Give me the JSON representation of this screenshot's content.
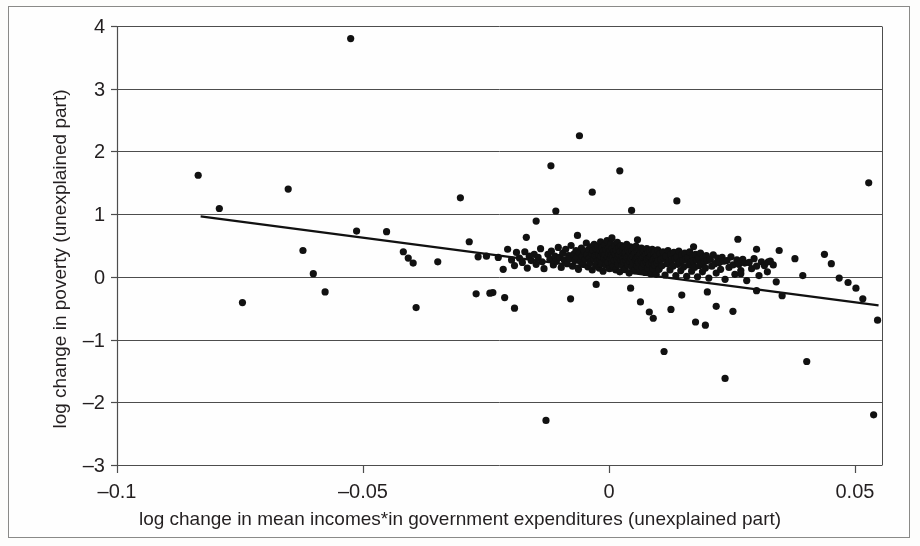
{
  "chart_data": {
    "type": "scatter",
    "title": "",
    "xlabel": "log change in mean incomes*in government expenditures (unexplained part)",
    "ylabel": "log change in poverty (unexplained part)",
    "xlim": [
      -0.1,
      0.0555
    ],
    "ylim": [
      -3,
      4
    ],
    "xticks": [
      -0.1,
      -0.05,
      0,
      0.05
    ],
    "xtick_labels": [
      "–0.1",
      "–0.05",
      "0",
      "0.05"
    ],
    "yticks": [
      -3,
      -2,
      -1,
      0,
      1,
      2,
      3,
      4
    ],
    "ytick_labels": [
      "–3",
      "–2",
      "–1",
      "0",
      "1",
      "2",
      "3",
      "4"
    ],
    "grid": "horizontal",
    "grid_color": "#4d4d4d",
    "marker_color": "#111111",
    "marker_size_px": 7.2,
    "legend": null,
    "trendline": {
      "label": "fitted regression line",
      "color": "#111111",
      "width_px": 2.2,
      "x_start": -0.083,
      "y_start": 0.965,
      "x_end": 0.0548,
      "y_end": -0.455
    },
    "n_points": 318,
    "points": [
      [
        -0.0835,
        1.62
      ],
      [
        -0.0792,
        1.09
      ],
      [
        -0.0652,
        1.4
      ],
      [
        -0.0745,
        -0.41
      ],
      [
        -0.0622,
        0.42
      ],
      [
        -0.0601,
        0.05
      ],
      [
        -0.0577,
        -0.24
      ],
      [
        -0.0525,
        3.8
      ],
      [
        -0.0513,
        0.73
      ],
      [
        -0.0452,
        0.72
      ],
      [
        -0.0418,
        0.4
      ],
      [
        -0.0408,
        0.3
      ],
      [
        -0.0398,
        0.22
      ],
      [
        -0.0392,
        -0.49
      ],
      [
        -0.0348,
        0.24
      ],
      [
        -0.0302,
        1.26
      ],
      [
        -0.0284,
        0.56
      ],
      [
        -0.0266,
        0.32
      ],
      [
        -0.0249,
        0.33
      ],
      [
        -0.0242,
        -0.26
      ],
      [
        -0.0225,
        0.31
      ],
      [
        -0.0215,
        0.12
      ],
      [
        -0.0206,
        0.44
      ],
      [
        -0.0198,
        0.27
      ],
      [
        -0.0192,
        0.18
      ],
      [
        -0.0188,
        0.39
      ],
      [
        -0.0182,
        0.3
      ],
      [
        -0.0176,
        0.23
      ],
      [
        -0.0171,
        0.4
      ],
      [
        -0.0166,
        0.14
      ],
      [
        -0.0162,
        0.33
      ],
      [
        -0.0158,
        0.26
      ],
      [
        -0.0152,
        0.36
      ],
      [
        -0.0148,
        0.2
      ],
      [
        -0.0144,
        0.31
      ],
      [
        -0.0139,
        0.45
      ],
      [
        -0.0136,
        0.24
      ],
      [
        -0.0132,
        0.13
      ],
      [
        -0.0128,
        -2.29
      ],
      [
        -0.0124,
        0.36
      ],
      [
        -0.012,
        0.28
      ],
      [
        -0.0117,
        0.41
      ],
      [
        -0.0113,
        0.19
      ],
      [
        -0.011,
        0.33
      ],
      [
        -0.0107,
        0.25
      ],
      [
        -0.0103,
        0.47
      ],
      [
        -0.01,
        0.31
      ],
      [
        -0.0097,
        0.15
      ],
      [
        -0.0094,
        0.38
      ],
      [
        -0.0091,
        0.27
      ],
      [
        -0.0088,
        0.44
      ],
      [
        -0.0085,
        0.21
      ],
      [
        -0.0082,
        0.34
      ],
      [
        -0.008,
        0.29
      ],
      [
        -0.0077,
        0.5
      ],
      [
        -0.0074,
        0.17
      ],
      [
        -0.0072,
        0.36
      ],
      [
        -0.0069,
        0.26
      ],
      [
        -0.0067,
        0.42
      ],
      [
        -0.0065,
        0.31
      ],
      [
        -0.0062,
        0.12
      ],
      [
        -0.006,
        0.38
      ],
      [
        -0.0058,
        0.24
      ],
      [
        -0.0056,
        0.46
      ],
      [
        -0.0054,
        0.33
      ],
      [
        -0.0052,
        0.2
      ],
      [
        -0.005,
        0.41
      ],
      [
        -0.0048,
        0.28
      ],
      [
        -0.0046,
        0.54
      ],
      [
        -0.0045,
        0.35
      ],
      [
        -0.0043,
        0.16
      ],
      [
        -0.0041,
        0.44
      ],
      [
        -0.004,
        0.3
      ],
      [
        -0.0038,
        0.23
      ],
      [
        -0.0037,
        0.48
      ],
      [
        -0.0035,
        0.37
      ],
      [
        -0.0034,
        0.11
      ],
      [
        -0.0032,
        0.42
      ],
      [
        -0.0031,
        0.29
      ],
      [
        -0.003,
        0.52
      ],
      [
        -0.0028,
        0.34
      ],
      [
        -0.0027,
        0.18
      ],
      [
        -0.0026,
        0.45
      ],
      [
        -0.0025,
        0.31
      ],
      [
        -0.0024,
        0.25
      ],
      [
        -0.0022,
        0.49
      ],
      [
        -0.0021,
        0.36
      ],
      [
        -0.002,
        0.14
      ],
      [
        -0.0019,
        0.43
      ],
      [
        -0.0018,
        0.28
      ],
      [
        -0.0017,
        0.56
      ],
      [
        -0.0016,
        0.33
      ],
      [
        -0.0015,
        0.21
      ],
      [
        -0.0014,
        0.47
      ],
      [
        -0.0013,
        0.38
      ],
      [
        -0.0012,
        0.09
      ],
      [
        -0.0011,
        0.41
      ],
      [
        -0.001,
        0.3
      ],
      [
        -0.0009,
        0.51
      ],
      [
        -0.0008,
        0.35
      ],
      [
        -0.0007,
        0.19
      ],
      [
        -0.0006,
        0.44
      ],
      [
        -0.0005,
        0.27
      ],
      [
        -0.0004,
        0.58
      ],
      [
        -0.0003,
        0.32
      ],
      [
        -0.0002,
        0.23
      ],
      [
        -0.0001,
        0.46
      ],
      [
        0.0,
        0.37
      ],
      [
        0.0001,
        0.13
      ],
      [
        0.0002,
        0.42
      ],
      [
        0.0003,
        0.29
      ],
      [
        0.0004,
        0.53
      ],
      [
        0.0005,
        0.34
      ],
      [
        0.0006,
        0.22
      ],
      [
        0.0007,
        0.45
      ],
      [
        0.0008,
        0.31
      ],
      [
        0.0009,
        0.17
      ],
      [
        0.001,
        0.4
      ],
      [
        0.0011,
        0.26
      ],
      [
        0.0012,
        0.49
      ],
      [
        0.0013,
        0.36
      ],
      [
        0.0014,
        0.11
      ],
      [
        0.0015,
        0.43
      ],
      [
        0.0016,
        0.28
      ],
      [
        0.0017,
        0.55
      ],
      [
        0.0018,
        0.33
      ],
      [
        0.0019,
        0.2
      ],
      [
        0.002,
        0.46
      ],
      [
        0.0021,
        0.35
      ],
      [
        0.0022,
        0.08
      ],
      [
        0.0023,
        0.41
      ],
      [
        0.0024,
        0.27
      ],
      [
        0.0025,
        0.5
      ],
      [
        0.0026,
        0.32
      ],
      [
        0.0027,
        0.18
      ],
      [
        0.0028,
        0.44
      ],
      [
        0.0029,
        0.3
      ],
      [
        0.003,
        0.24
      ],
      [
        0.0031,
        0.47
      ],
      [
        0.0032,
        0.37
      ],
      [
        0.0033,
        0.12
      ],
      [
        0.0034,
        0.39
      ],
      [
        0.0035,
        0.26
      ],
      [
        0.0036,
        0.52
      ],
      [
        0.0037,
        0.31
      ],
      [
        0.0038,
        0.19
      ],
      [
        0.0039,
        0.43
      ],
      [
        0.004,
        0.34
      ],
      [
        0.0041,
        0.06
      ],
      [
        0.0042,
        0.4
      ],
      [
        0.0043,
        0.25
      ],
      [
        0.0044,
        0.48
      ],
      [
        0.0045,
        0.29
      ],
      [
        0.0046,
        0.16
      ],
      [
        0.0047,
        0.42
      ],
      [
        0.0048,
        0.33
      ],
      [
        0.0049,
        0.22
      ],
      [
        0.005,
        0.45
      ],
      [
        0.0051,
        0.35
      ],
      [
        0.0052,
        0.1
      ],
      [
        0.0053,
        0.38
      ],
      [
        0.0054,
        0.27
      ],
      [
        0.0055,
        0.49
      ],
      [
        0.0056,
        0.3
      ],
      [
        0.0057,
        0.17
      ],
      [
        0.0058,
        0.41
      ],
      [
        0.0059,
        0.32
      ],
      [
        0.006,
        0.23
      ],
      [
        0.0061,
        0.44
      ],
      [
        0.0062,
        0.34
      ],
      [
        0.0063,
        0.09
      ],
      [
        0.0064,
        0.37
      ],
      [
        0.0065,
        0.26
      ],
      [
        0.0066,
        0.46
      ],
      [
        0.0067,
        0.29
      ],
      [
        0.0068,
        0.15
      ],
      [
        0.0069,
        0.4
      ],
      [
        0.007,
        0.31
      ],
      [
        0.0071,
        0.21
      ],
      [
        0.0072,
        0.43
      ],
      [
        0.0073,
        0.33
      ],
      [
        0.0074,
        0.07
      ],
      [
        0.0075,
        0.36
      ],
      [
        0.0076,
        0.24
      ],
      [
        0.0077,
        0.45
      ],
      [
        0.0078,
        0.28
      ],
      [
        0.0079,
        0.14
      ],
      [
        0.008,
        0.39
      ],
      [
        0.0081,
        0.3
      ],
      [
        0.0082,
        0.2
      ],
      [
        0.0083,
        0.42
      ],
      [
        0.0084,
        0.32
      ],
      [
        0.0085,
        0.05
      ],
      [
        0.0086,
        0.35
      ],
      [
        0.0087,
        0.23
      ],
      [
        0.0088,
        0.44
      ],
      [
        0.0089,
        0.27
      ],
      [
        0.009,
        0.13
      ],
      [
        0.0091,
        0.38
      ],
      [
        0.0092,
        0.29
      ],
      [
        0.0093,
        0.19
      ],
      [
        0.0094,
        0.41
      ],
      [
        0.0095,
        0.31
      ],
      [
        0.0096,
        0.04
      ],
      [
        0.0097,
        0.34
      ],
      [
        0.0098,
        0.22
      ],
      [
        0.0099,
        0.43
      ],
      [
        0.01,
        0.26
      ],
      [
        0.0102,
        0.12
      ],
      [
        0.0104,
        0.37
      ],
      [
        0.0106,
        0.28
      ],
      [
        0.0108,
        0.18
      ],
      [
        0.011,
        0.4
      ],
      [
        0.0112,
        0.3
      ],
      [
        0.0114,
        0.03
      ],
      [
        0.0116,
        0.33
      ],
      [
        0.0118,
        0.21
      ],
      [
        0.012,
        0.42
      ],
      [
        0.0122,
        0.25
      ],
      [
        0.0124,
        0.11
      ],
      [
        0.0126,
        0.36
      ],
      [
        0.0128,
        0.27
      ],
      [
        0.013,
        0.17
      ],
      [
        0.0132,
        0.39
      ],
      [
        0.0134,
        0.29
      ],
      [
        0.0136,
        0.02
      ],
      [
        0.0138,
        0.32
      ],
      [
        0.014,
        0.2
      ],
      [
        0.0142,
        0.41
      ],
      [
        0.0144,
        0.24
      ],
      [
        0.0146,
        0.1
      ],
      [
        0.0148,
        0.35
      ],
      [
        0.015,
        0.26
      ],
      [
        0.0152,
        0.16
      ],
      [
        0.0154,
        0.38
      ],
      [
        0.0156,
        0.28
      ],
      [
        0.0158,
        0.01
      ],
      [
        0.016,
        0.31
      ],
      [
        0.0162,
        0.19
      ],
      [
        0.0164,
        0.4
      ],
      [
        0.0166,
        0.23
      ],
      [
        0.0168,
        0.09
      ],
      [
        0.017,
        0.34
      ],
      [
        0.0172,
        0.25
      ],
      [
        0.0174,
        0.15
      ],
      [
        0.0176,
        0.36
      ],
      [
        0.0178,
        0.27
      ],
      [
        0.018,
        0.0
      ],
      [
        0.0182,
        0.3
      ],
      [
        0.0184,
        0.18
      ],
      [
        0.0186,
        0.38
      ],
      [
        0.0188,
        0.22
      ],
      [
        0.019,
        0.08
      ],
      [
        0.0192,
        0.32
      ],
      [
        0.0194,
        0.24
      ],
      [
        0.0196,
        0.14
      ],
      [
        0.0198,
        0.34
      ],
      [
        0.02,
        0.26
      ],
      [
        0.0203,
        -0.02
      ],
      [
        0.0206,
        0.28
      ],
      [
        0.0209,
        0.17
      ],
      [
        0.0212,
        0.35
      ],
      [
        0.0215,
        0.21
      ],
      [
        0.0218,
        0.06
      ],
      [
        0.0221,
        0.3
      ],
      [
        0.0224,
        0.23
      ],
      [
        0.0227,
        0.12
      ],
      [
        0.023,
        0.31
      ],
      [
        0.0233,
        0.25
      ],
      [
        0.0236,
        -0.04
      ],
      [
        0.024,
        0.26
      ],
      [
        0.0244,
        0.15
      ],
      [
        0.0248,
        0.32
      ],
      [
        0.0252,
        0.19
      ],
      [
        0.0256,
        0.04
      ],
      [
        0.026,
        0.27
      ],
      [
        0.0264,
        0.2
      ],
      [
        0.0268,
        0.1
      ],
      [
        0.0272,
        0.28
      ],
      [
        0.0276,
        0.22
      ],
      [
        0.028,
        -0.06
      ],
      [
        0.0285,
        0.23
      ],
      [
        0.029,
        0.13
      ],
      [
        0.0295,
        0.29
      ],
      [
        0.03,
        0.17
      ],
      [
        0.0305,
        0.02
      ],
      [
        0.031,
        0.24
      ],
      [
        0.0316,
        0.18
      ],
      [
        0.0322,
        0.08
      ],
      [
        0.0328,
        0.25
      ],
      [
        0.0334,
        0.19
      ],
      [
        0.034,
        -0.08
      ],
      [
        -0.027,
        -0.27
      ],
      [
        -0.0236,
        -0.25
      ],
      [
        -0.0192,
        -0.5
      ],
      [
        -0.0148,
        0.89
      ],
      [
        -0.0118,
        1.77
      ],
      [
        -0.0108,
        1.05
      ],
      [
        -0.006,
        2.25
      ],
      [
        -0.0034,
        1.35
      ],
      [
        0.0022,
        1.69
      ],
      [
        0.0046,
        1.06
      ],
      [
        0.0082,
        -0.56
      ],
      [
        0.009,
        -0.66
      ],
      [
        0.0112,
        -1.19
      ],
      [
        0.0138,
        1.21
      ],
      [
        0.0176,
        -0.72
      ],
      [
        0.0196,
        -0.77
      ],
      [
        0.0218,
        -0.47
      ],
      [
        0.0236,
        -1.62
      ],
      [
        0.0262,
        0.6
      ],
      [
        0.03,
        -0.22
      ],
      [
        0.0324,
        0.24
      ],
      [
        0.0346,
        0.42
      ],
      [
        0.0352,
        -0.3
      ],
      [
        0.0378,
        0.29
      ],
      [
        0.0394,
        0.02
      ],
      [
        0.0402,
        -1.35
      ],
      [
        0.0438,
        0.36
      ],
      [
        0.0452,
        0.21
      ],
      [
        0.0468,
        -0.02
      ],
      [
        0.0486,
        -0.09
      ],
      [
        0.0502,
        -0.18
      ],
      [
        0.0516,
        -0.35
      ],
      [
        0.0528,
        1.5
      ],
      [
        0.0538,
        -2.2
      ],
      [
        0.0546,
        -0.69
      ],
      [
        0.03,
        0.44
      ],
      [
        -0.0168,
        0.63
      ],
      [
        -0.0064,
        0.66
      ],
      [
        0.0006,
        0.62
      ],
      [
        0.0058,
        0.59
      ],
      [
        -0.0212,
        -0.33
      ],
      [
        0.0064,
        -0.4
      ],
      [
        0.0148,
        -0.29
      ],
      [
        -0.0078,
        -0.35
      ],
      [
        0.0126,
        -0.52
      ],
      [
        0.0172,
        0.48
      ],
      [
        0.0252,
        -0.55
      ],
      [
        0.0268,
        0.05
      ],
      [
        0.0044,
        -0.18
      ],
      [
        -0.0026,
        -0.12
      ],
      [
        0.02,
        -0.24
      ]
    ]
  }
}
